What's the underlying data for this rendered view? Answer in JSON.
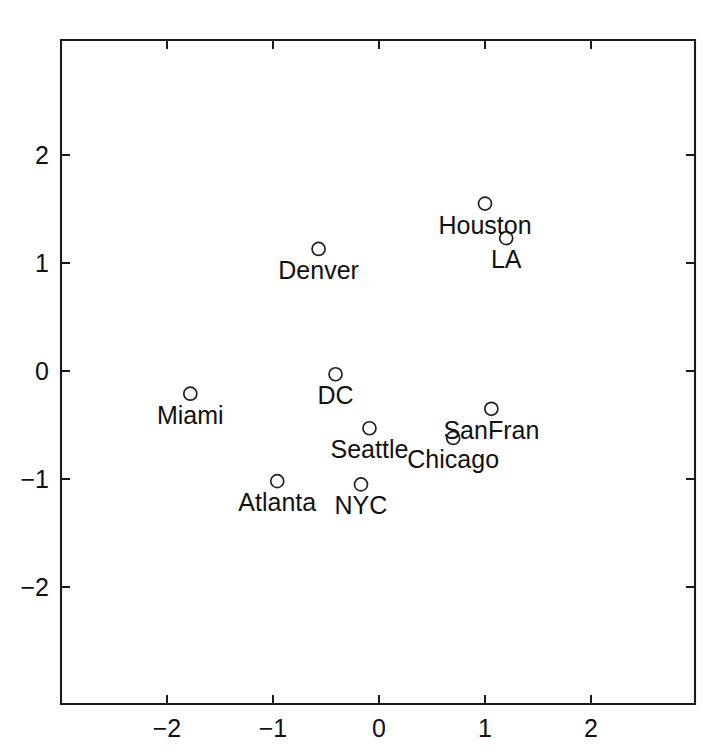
{
  "chart_data": {
    "type": "scatter",
    "title": "",
    "xlabel": "",
    "ylabel": "",
    "xlim": [
      -3.0,
      2.98
    ],
    "ylim": [
      -3.08,
      3.06
    ],
    "grid": false,
    "legend": "none",
    "marker": "open-circle",
    "labels_position": "below-marker",
    "xticks": [
      -2,
      -1,
      0,
      1,
      2
    ],
    "xtick_labels": [
      "−2",
      "−1",
      "0",
      "1",
      "2"
    ],
    "yticks": [
      -2,
      -1,
      0,
      1,
      2
    ],
    "ytick_labels": [
      "−2",
      "−1",
      "0",
      "1",
      "2"
    ],
    "points": [
      {
        "label": "Houston",
        "x": 1.0,
        "y": 1.55
      },
      {
        "label": "LA",
        "x": 1.2,
        "y": 1.23
      },
      {
        "label": "Denver",
        "x": -0.57,
        "y": 1.13
      },
      {
        "label": "DC",
        "x": -0.41,
        "y": -0.03
      },
      {
        "label": "Miami",
        "x": -1.78,
        "y": -0.21
      },
      {
        "label": "SanFran",
        "x": 1.06,
        "y": -0.35
      },
      {
        "label": "Seattle",
        "x": -0.09,
        "y": -0.53
      },
      {
        "label": "Chicago",
        "x": 0.7,
        "y": -0.62
      },
      {
        "label": "Atlanta",
        "x": -0.96,
        "y": -1.02
      },
      {
        "label": "NYC",
        "x": -0.17,
        "y": -1.05
      }
    ],
    "colors": {
      "axis": "#1a1a1a",
      "marker_stroke": "#222222",
      "text": "#111111",
      "background": "#ffffff"
    }
  }
}
